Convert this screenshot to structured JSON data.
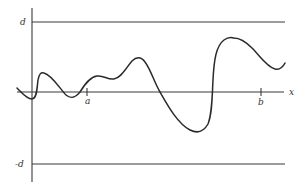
{
  "figure": {
    "type": "function-bound-diagram",
    "labels": {
      "upper_bound": "d",
      "lower_bound": "-d",
      "x_axis": "x",
      "tick_a": "a",
      "tick_b": "b"
    },
    "geometry": {
      "y_axis_x": 32,
      "y_axis_top": 8,
      "y_axis_bottom": 182,
      "x_axis_y": 92,
      "x_axis_left": 17,
      "x_axis_right": 284,
      "upper_line_y": 22,
      "lower_line_y": 164,
      "bound_line_left": 32,
      "bound_line_right": 285,
      "tick_a_x": 87,
      "tick_b_x": 261
    },
    "curve_path": "M17,88 C22,93 27,99 32,99 C37,99 37,88 38,80 C39,74 41,72 44,73 C52,75 60,89 66,95 C71,99 75,98 80,92 C85,84 90,77 97,76 C104,75 107,80 114,79 C121,78 126,68 132,61 C136,57 141,56 145,62 C151,70 154,82 160,92 C168,106 178,124 190,130 C198,134 204,131 208,124 C212,114 212,100 213,80 C214,60 216,46 224,40 C228,37 231,37 234,38 C241,38 246,42 252,48 C260,56 267,67 275,69 C280,70 283,67 285,63",
    "colors": {
      "ink": "#2a2a2a",
      "background": "#ffffff"
    }
  }
}
